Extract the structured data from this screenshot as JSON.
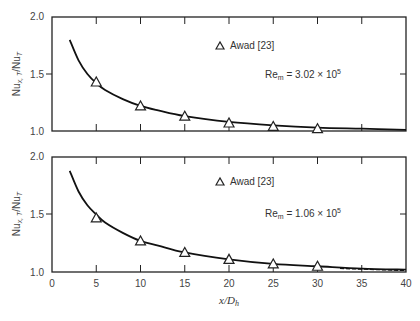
{
  "chart_data": [
    {
      "type": "line",
      "panel": "top",
      "title": "",
      "xlabel": "x/D_h",
      "ylabel": "Nu_x,T/Nu_T",
      "xlim": [
        0,
        40
      ],
      "ylim": [
        1.0,
        2.0
      ],
      "x_ticks": [
        0,
        5,
        10,
        15,
        20,
        25,
        30,
        35,
        40
      ],
      "y_ticks": [
        "1.0",
        "1.5",
        "2.0"
      ],
      "grid": false,
      "annotation": "Re_m = 3.02 × 10^5",
      "legend": [
        {
          "marker": "triangle",
          "label": "Awad [23]"
        }
      ],
      "series": [
        {
          "name": "theory curve",
          "style": "solid line",
          "x": [
            2,
            3,
            4,
            5,
            6,
            8,
            10,
            12,
            15,
            20,
            25,
            30,
            35,
            40
          ],
          "y": [
            1.8,
            1.62,
            1.5,
            1.42,
            1.36,
            1.28,
            1.22,
            1.18,
            1.13,
            1.08,
            1.05,
            1.03,
            1.02,
            1.01
          ]
        },
        {
          "name": "Awad [23]",
          "style": "triangle markers",
          "x": [
            5,
            10,
            15,
            20,
            25,
            30
          ],
          "y": [
            1.43,
            1.22,
            1.13,
            1.07,
            1.04,
            1.02
          ]
        }
      ]
    },
    {
      "type": "line",
      "panel": "bottom",
      "title": "",
      "xlabel": "x/D_h",
      "ylabel": "Nu_x,T/Nu_T",
      "xlim": [
        0,
        40
      ],
      "ylim": [
        1.0,
        2.0
      ],
      "x_ticks": [
        0,
        5,
        10,
        15,
        20,
        25,
        30,
        35,
        40
      ],
      "y_ticks": [
        "1.0",
        "1.5",
        "2.0"
      ],
      "grid": false,
      "annotation": "Re_m = 1.06 × 10^5",
      "legend": [
        {
          "marker": "triangle",
          "label": "Awad [23]"
        }
      ],
      "series": [
        {
          "name": "theory curve",
          "style": "solid line (dashed near end)",
          "x": [
            2,
            3,
            4,
            5,
            6,
            8,
            10,
            12,
            15,
            20,
            25,
            30,
            35,
            40
          ],
          "y": [
            1.88,
            1.7,
            1.58,
            1.5,
            1.43,
            1.34,
            1.27,
            1.23,
            1.17,
            1.11,
            1.07,
            1.05,
            1.03,
            1.02
          ]
        },
        {
          "name": "Awad [23]",
          "style": "triangle markers",
          "x": [
            5,
            10,
            15,
            20,
            25,
            30
          ],
          "y": [
            1.47,
            1.27,
            1.17,
            1.11,
            1.07,
            1.05
          ]
        }
      ]
    }
  ],
  "labels": {
    "ylabel_main": "Nu",
    "ylabel_sub": "x, T",
    "ylabel_den": "/Nu",
    "ylabel_den_sub": "T",
    "xlabel_main": "x/D",
    "xlabel_sub": "h",
    "legend_label": "Awad [23]",
    "top_re_prefix": "Re",
    "top_re_sub": "m",
    "top_re_value": " = 3.02 × 10",
    "top_re_exp": "5",
    "bottom_re_prefix": "Re",
    "bottom_re_sub": "m",
    "bottom_re_value": " = 1.06 × 10",
    "bottom_re_exp": "5",
    "y_tick_top": "2.0",
    "y_tick_mid": "1.5",
    "y_tick_bot": "1.0",
    "x_ticks": [
      "0",
      "5",
      "10",
      "15",
      "20",
      "25",
      "30",
      "35",
      "40"
    ]
  }
}
